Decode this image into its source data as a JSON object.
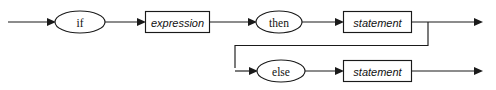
{
  "diagram": {
    "kind": "railroad-syntax-diagram",
    "canvas": {
      "width": 496,
      "height": 90,
      "background": "#ffffff"
    },
    "line_color": "#1a1a1a",
    "text_color": "#111111",
    "nodes": [
      {
        "id": "if",
        "label": "if",
        "shape": "ellipse",
        "type": "terminal",
        "cx": 80,
        "cy": 22,
        "rx": 25,
        "ry": 11
      },
      {
        "id": "expression",
        "label": "expression",
        "shape": "rect",
        "type": "nonterminal",
        "x": 145,
        "y": 11,
        "width": 65,
        "height": 22
      },
      {
        "id": "then",
        "label": "then",
        "shape": "ellipse",
        "type": "terminal",
        "cx": 279,
        "cy": 22,
        "rx": 23,
        "ry": 11
      },
      {
        "id": "statement-then",
        "label": "statement",
        "shape": "rect",
        "type": "nonterminal",
        "x": 343,
        "y": 11,
        "width": 69,
        "height": 22
      },
      {
        "id": "else",
        "label": "else",
        "shape": "ellipse",
        "type": "terminal",
        "cx": 281,
        "cy": 71,
        "rx": 24,
        "ry": 11
      },
      {
        "id": "statement-else",
        "label": "statement",
        "shape": "rect",
        "type": "nonterminal",
        "x": 343,
        "y": 60,
        "width": 69,
        "height": 22
      }
    ],
    "edges": [
      {
        "id": "entry-to-if",
        "path": "M8,22 L52,22",
        "arrow_at": [
          55,
          22
        ],
        "direction": "right"
      },
      {
        "id": "if-to-expression",
        "path": "M105,22 L142,22",
        "arrow_at": [
          145,
          22
        ],
        "direction": "right"
      },
      {
        "id": "expression-to-then",
        "path": "M210,22 L253,22",
        "arrow_at": [
          256,
          22
        ],
        "direction": "right"
      },
      {
        "id": "then-to-statement",
        "path": "M302,22 L340,22",
        "arrow_at": [
          343,
          22
        ],
        "direction": "right"
      },
      {
        "id": "statement-to-exit",
        "path": "M412,22 L479,22",
        "arrow_at": [
          482,
          22
        ],
        "direction": "right"
      },
      {
        "id": "branch-down-and-back",
        "path": "M428,22 L428,45 L235,45 L235,68",
        "arrow_at": [
          null,
          null
        ],
        "direction": "none"
      },
      {
        "id": "branch-to-else",
        "path": "M235,71 L254,71",
        "arrow_at": [
          257,
          71
        ],
        "direction": "right"
      },
      {
        "id": "else-to-statement",
        "path": "M305,71 L340,71",
        "arrow_at": [
          343,
          71
        ],
        "direction": "right"
      },
      {
        "id": "statement-else-to-exit",
        "path": "M412,71 L479,71",
        "arrow_at": [
          482,
          71
        ],
        "direction": "right"
      }
    ]
  }
}
